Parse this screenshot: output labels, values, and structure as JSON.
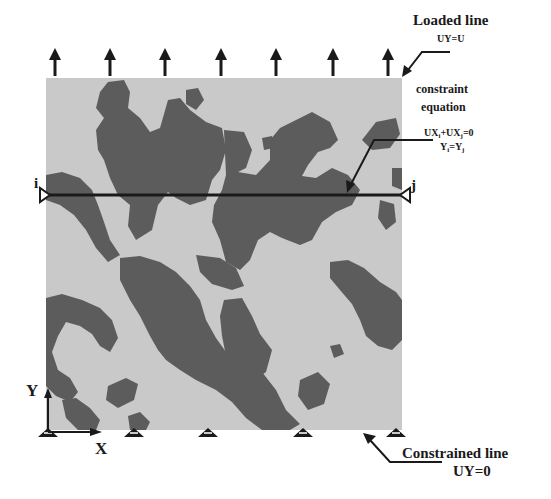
{
  "figure": {
    "loaded_line": {
      "title": "Loaded line",
      "condition": "UY=U"
    },
    "constraint": {
      "title_line1": "constraint",
      "title_line2": "equation",
      "eq1_a": "UX",
      "eq1_a_sub": "i",
      "eq1_b": "+UX",
      "eq1_b_sub": "j",
      "eq1_c": "=0",
      "eq2_a": "Y",
      "eq2_a_sub": "i",
      "eq2_b": "=Y",
      "eq2_b_sub": "j"
    },
    "constrained_line": {
      "title": "Constrained line",
      "condition": "UY=0"
    },
    "nodes": {
      "left": "i",
      "right": "j"
    },
    "axes": {
      "x_label": "X",
      "y_label": "Y"
    },
    "load_arrow_count": 7,
    "support_count": 5,
    "colors": {
      "matrix_phase": "#c9c9c9",
      "inclusion_phase": "#5c5c5c",
      "lines": "#1a1a1a"
    }
  }
}
